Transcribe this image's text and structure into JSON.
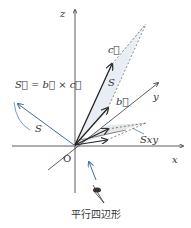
{
  "diagram": {
    "axes": {
      "x": "x",
      "y": "y",
      "z": "z"
    },
    "origin": "O",
    "vectors": {
      "b": "b⃗",
      "c": "c⃗"
    },
    "area_label": "S",
    "cross_product": "S⃗ = b⃗ × c⃗",
    "normal_area_label": "S",
    "projection_label": "Sxy",
    "caption": "平行四辺形",
    "colors": {
      "line": "#333333",
      "accent": "#3a6ea8",
      "fill": "#dfe7ef"
    }
  }
}
